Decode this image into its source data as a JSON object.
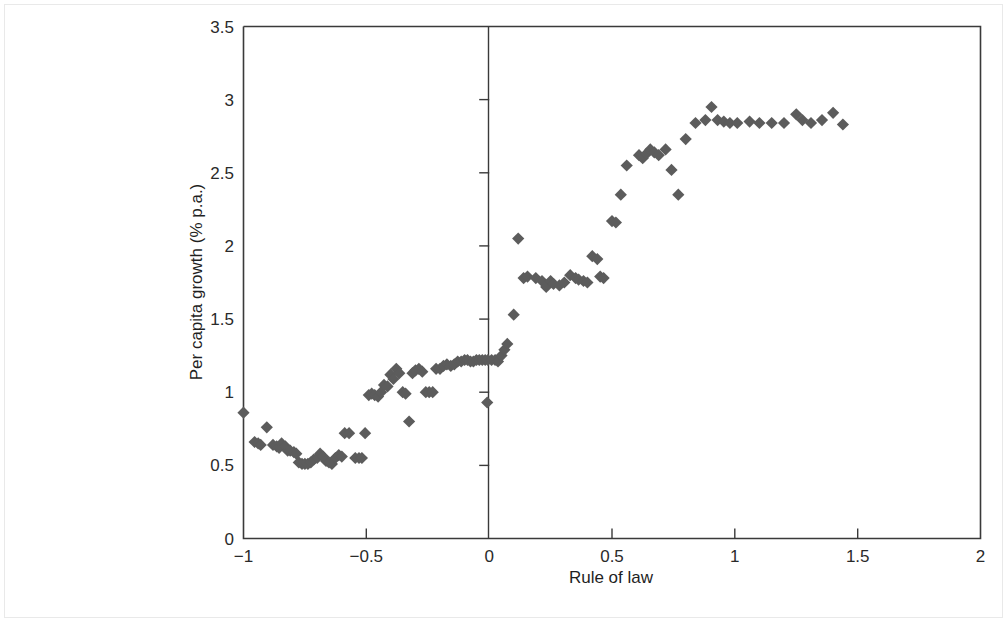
{
  "chart_data": {
    "type": "scatter",
    "title": "",
    "xlabel": "Rule of law",
    "ylabel": "Per capita growth (% p.a.)",
    "xlim": [
      -1,
      2
    ],
    "ylim": [
      0,
      3.5
    ],
    "xticks": [
      -1,
      -0.5,
      0,
      0.5,
      1,
      1.5,
      2
    ],
    "xticklabels": [
      "−1",
      "−0.5",
      "0",
      "0.5",
      "1",
      "1.5",
      "2"
    ],
    "yticks": [
      0,
      0.5,
      1,
      1.5,
      2,
      2.5,
      3,
      3.5
    ],
    "yticklabels": [
      "0",
      "0.5",
      "1",
      "1.5",
      "2",
      "2.5",
      "3",
      "3.5"
    ],
    "grid": false,
    "legend": null,
    "marker": {
      "shape": "diamond",
      "color": "#5c5c5c",
      "size": 11
    },
    "series": [
      {
        "name": "Countries",
        "points": [
          [
            -1.0,
            0.86
          ],
          [
            -0.955,
            0.66
          ],
          [
            -0.94,
            0.65
          ],
          [
            -0.93,
            0.64
          ],
          [
            -0.905,
            0.76
          ],
          [
            -0.88,
            0.64
          ],
          [
            -0.865,
            0.63
          ],
          [
            -0.855,
            0.62
          ],
          [
            -0.845,
            0.65
          ],
          [
            -0.83,
            0.63
          ],
          [
            -0.82,
            0.6
          ],
          [
            -0.81,
            0.6
          ],
          [
            -0.795,
            0.59
          ],
          [
            -0.785,
            0.58
          ],
          [
            -0.775,
            0.52
          ],
          [
            -0.762,
            0.51
          ],
          [
            -0.75,
            0.51
          ],
          [
            -0.738,
            0.51
          ],
          [
            -0.726,
            0.52
          ],
          [
            -0.714,
            0.54
          ],
          [
            -0.7,
            0.55
          ],
          [
            -0.688,
            0.58
          ],
          [
            -0.676,
            0.56
          ],
          [
            -0.664,
            0.53
          ],
          [
            -0.652,
            0.52
          ],
          [
            -0.64,
            0.51
          ],
          [
            -0.626,
            0.55
          ],
          [
            -0.612,
            0.57
          ],
          [
            -0.6,
            0.56
          ],
          [
            -0.588,
            0.72
          ],
          [
            -0.57,
            0.72
          ],
          [
            -0.545,
            0.55
          ],
          [
            -0.53,
            0.55
          ],
          [
            -0.518,
            0.55
          ],
          [
            -0.505,
            0.72
          ],
          [
            -0.49,
            0.98
          ],
          [
            -0.478,
            0.99
          ],
          [
            -0.466,
            0.98
          ],
          [
            -0.452,
            0.97
          ],
          [
            -0.44,
            1.0
          ],
          [
            -0.428,
            1.05
          ],
          [
            -0.414,
            1.04
          ],
          [
            -0.402,
            1.12
          ],
          [
            -0.39,
            1.09
          ],
          [
            -0.378,
            1.16
          ],
          [
            -0.366,
            1.13
          ],
          [
            -0.352,
            1.0
          ],
          [
            -0.34,
            0.99
          ],
          [
            -0.326,
            0.8
          ],
          [
            -0.312,
            1.13
          ],
          [
            -0.3,
            1.15
          ],
          [
            -0.286,
            1.16
          ],
          [
            -0.272,
            1.14
          ],
          [
            -0.258,
            1.0
          ],
          [
            -0.244,
            1.0
          ],
          [
            -0.23,
            1.0
          ],
          [
            -0.216,
            1.16
          ],
          [
            -0.2,
            1.16
          ],
          [
            -0.186,
            1.18
          ],
          [
            -0.172,
            1.19
          ],
          [
            -0.156,
            1.18
          ],
          [
            -0.142,
            1.19
          ],
          [
            -0.128,
            1.21
          ],
          [
            -0.114,
            1.21
          ],
          [
            -0.1,
            1.22
          ],
          [
            -0.088,
            1.22
          ],
          [
            -0.076,
            1.21
          ],
          [
            -0.064,
            1.21
          ],
          [
            -0.052,
            1.22
          ],
          [
            -0.04,
            1.22
          ],
          [
            -0.028,
            1.22
          ],
          [
            -0.016,
            1.22
          ],
          [
            -0.005,
            1.22
          ],
          [
            -0.008,
            0.93
          ],
          [
            0.01,
            1.22
          ],
          [
            0.024,
            1.22
          ],
          [
            0.036,
            1.21
          ],
          [
            0.05,
            1.25
          ],
          [
            0.062,
            1.29
          ],
          [
            0.074,
            1.33
          ],
          [
            0.1,
            1.53
          ],
          [
            0.118,
            2.05
          ],
          [
            0.14,
            1.78
          ],
          [
            0.156,
            1.79
          ],
          [
            0.19,
            1.78
          ],
          [
            0.215,
            1.76
          ],
          [
            0.232,
            1.72
          ],
          [
            0.25,
            1.76
          ],
          [
            0.262,
            1.74
          ],
          [
            0.286,
            1.73
          ],
          [
            0.306,
            1.75
          ],
          [
            0.33,
            1.8
          ],
          [
            0.352,
            1.78
          ],
          [
            0.364,
            1.77
          ],
          [
            0.384,
            1.76
          ],
          [
            0.4,
            1.75
          ],
          [
            0.42,
            1.93
          ],
          [
            0.44,
            1.91
          ],
          [
            0.452,
            1.79
          ],
          [
            0.466,
            1.78
          ],
          [
            0.5,
            2.17
          ],
          [
            0.516,
            2.16
          ],
          [
            0.536,
            2.35
          ],
          [
            0.56,
            2.55
          ],
          [
            0.61,
            2.62
          ],
          [
            0.625,
            2.6
          ],
          [
            0.64,
            2.63
          ],
          [
            0.656,
            2.66
          ],
          [
            0.672,
            2.64
          ],
          [
            0.69,
            2.62
          ],
          [
            0.718,
            2.66
          ],
          [
            0.742,
            2.52
          ],
          [
            0.77,
            2.35
          ],
          [
            0.8,
            2.73
          ],
          [
            0.84,
            2.84
          ],
          [
            0.88,
            2.86
          ],
          [
            0.905,
            2.95
          ],
          [
            0.93,
            2.86
          ],
          [
            0.955,
            2.85
          ],
          [
            0.98,
            2.84
          ],
          [
            1.01,
            2.84
          ],
          [
            1.06,
            2.85
          ],
          [
            1.1,
            2.84
          ],
          [
            1.15,
            2.84
          ],
          [
            1.2,
            2.84
          ],
          [
            1.25,
            2.9
          ],
          [
            1.275,
            2.86
          ],
          [
            1.31,
            2.84
          ],
          [
            1.355,
            2.86
          ],
          [
            1.4,
            2.91
          ],
          [
            1.44,
            2.83
          ]
        ]
      }
    ]
  }
}
